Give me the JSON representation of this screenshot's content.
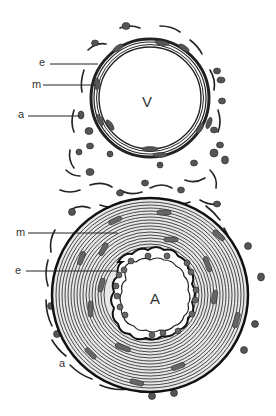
{
  "figure": {
    "colors": {
      "background": "#ffffff",
      "ink": "#222222",
      "nucleus": "#555555",
      "muscle": "#6a6a6a"
    },
    "vein": {
      "lumen_label": "V",
      "labels": [
        {
          "text": "e",
          "meaning": "endothelium"
        },
        {
          "text": "m",
          "meaning": "media"
        },
        {
          "text": "a",
          "meaning": "adventitia"
        }
      ]
    },
    "artery": {
      "lumen_label": "A",
      "labels": [
        {
          "text": "m",
          "meaning": "media"
        },
        {
          "text": "e",
          "meaning": "endothelium"
        },
        {
          "text": "a",
          "meaning": "adventitia"
        }
      ]
    }
  }
}
